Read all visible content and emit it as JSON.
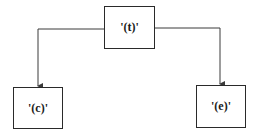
{
  "diagram": {
    "type": "tree",
    "nodes": [
      {
        "id": "t",
        "label": "'(t)'",
        "x": 104,
        "y": 6,
        "w": 51,
        "h": 43
      },
      {
        "id": "c",
        "label": "'(c)'",
        "x": 13,
        "y": 87,
        "w": 50,
        "h": 42
      },
      {
        "id": "e",
        "label": "'(e)'",
        "x": 196,
        "y": 85,
        "w": 50,
        "h": 43
      }
    ],
    "edges": [
      {
        "from": "t",
        "to": "c",
        "directed": true
      },
      {
        "from": "t",
        "to": "e",
        "directed": true
      }
    ],
    "colors": {
      "line": "#3a3a3a",
      "border": "#2a2a2a",
      "text": "#1a1a1a",
      "background": "#ffffff"
    }
  }
}
